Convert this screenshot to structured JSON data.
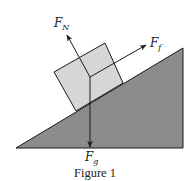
{
  "figure": {
    "caption": "Figure 1",
    "forces": {
      "normal": {
        "symbol": "F",
        "subscript": "N"
      },
      "friction": {
        "symbol": "F",
        "subscript": "f"
      },
      "gravity": {
        "symbol": "F",
        "subscript": "g"
      }
    },
    "colors": {
      "incline": "#8c8c8c",
      "block": "#d6d6d6",
      "stroke": "#1a1a1a"
    }
  }
}
